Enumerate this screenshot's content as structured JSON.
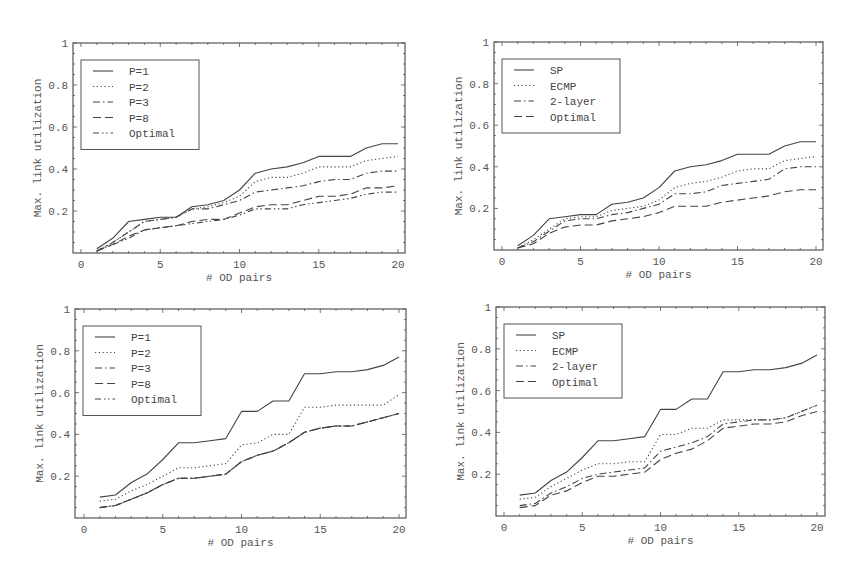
{
  "chart_data": [
    {
      "type": "line",
      "panel": "top-left",
      "title": "",
      "xlabel": "# OD pairs",
      "ylabel": "Max. link utilization",
      "xlim": [
        0,
        20
      ],
      "ylim": [
        0,
        1
      ],
      "xticks": [
        "0",
        "5",
        "10",
        "15",
        "20"
      ],
      "yticks": [
        "0.2",
        "0.4",
        "0.6",
        "0.8",
        "1"
      ],
      "grid": false,
      "legend_position": "upper-left",
      "x": [
        1,
        2,
        3,
        4,
        5,
        6,
        7,
        8,
        9,
        10,
        11,
        12,
        13,
        14,
        15,
        16,
        17,
        18,
        19,
        20
      ],
      "series": [
        {
          "name": "P=1",
          "style": "solid",
          "values": [
            0.02,
            0.07,
            0.15,
            0.16,
            0.17,
            0.17,
            0.22,
            0.23,
            0.25,
            0.3,
            0.38,
            0.4,
            0.41,
            0.43,
            0.46,
            0.46,
            0.46,
            0.5,
            0.52,
            0.52
          ]
        },
        {
          "name": "P=2",
          "style": "dotted",
          "values": [
            0.01,
            0.05,
            0.1,
            0.15,
            0.16,
            0.17,
            0.21,
            0.22,
            0.24,
            0.27,
            0.34,
            0.36,
            0.36,
            0.38,
            0.41,
            0.41,
            0.41,
            0.44,
            0.45,
            0.46
          ]
        },
        {
          "name": "P=3",
          "style": "dashdot",
          "values": [
            0.01,
            0.05,
            0.1,
            0.15,
            0.16,
            0.17,
            0.21,
            0.21,
            0.23,
            0.25,
            0.29,
            0.3,
            0.31,
            0.32,
            0.34,
            0.35,
            0.35,
            0.38,
            0.39,
            0.39
          ]
        },
        {
          "name": "P=8",
          "style": "longdash",
          "values": [
            0.01,
            0.04,
            0.08,
            0.11,
            0.12,
            0.13,
            0.15,
            0.16,
            0.16,
            0.19,
            0.22,
            0.23,
            0.23,
            0.25,
            0.27,
            0.27,
            0.28,
            0.31,
            0.31,
            0.32
          ]
        },
        {
          "name": "Optimal",
          "style": "dashdotdot",
          "values": [
            0.01,
            0.04,
            0.07,
            0.11,
            0.12,
            0.13,
            0.14,
            0.15,
            0.16,
            0.18,
            0.21,
            0.21,
            0.21,
            0.23,
            0.24,
            0.25,
            0.26,
            0.28,
            0.29,
            0.29
          ]
        }
      ]
    },
    {
      "type": "line",
      "panel": "top-right",
      "title": "",
      "xlabel": "# OD pairs",
      "ylabel": "Max. link utilization",
      "xlim": [
        0,
        20
      ],
      "ylim": [
        0,
        1
      ],
      "xticks": [
        "0",
        "5",
        "10",
        "15",
        "20"
      ],
      "yticks": [
        "0.2",
        "0.4",
        "0.6",
        "0.8",
        "1"
      ],
      "grid": false,
      "legend_position": "upper-left",
      "x": [
        1,
        2,
        3,
        4,
        5,
        6,
        7,
        8,
        9,
        10,
        11,
        12,
        13,
        14,
        15,
        16,
        17,
        18,
        19,
        20
      ],
      "series": [
        {
          "name": "SP",
          "style": "solid",
          "values": [
            0.02,
            0.07,
            0.15,
            0.16,
            0.17,
            0.17,
            0.22,
            0.23,
            0.25,
            0.3,
            0.38,
            0.4,
            0.41,
            0.43,
            0.46,
            0.46,
            0.46,
            0.5,
            0.52,
            0.52
          ]
        },
        {
          "name": "ECMP",
          "style": "dotted",
          "values": [
            0.01,
            0.05,
            0.1,
            0.15,
            0.16,
            0.16,
            0.19,
            0.2,
            0.21,
            0.24,
            0.3,
            0.32,
            0.33,
            0.35,
            0.38,
            0.39,
            0.39,
            0.43,
            0.44,
            0.45
          ]
        },
        {
          "name": "2-layer",
          "style": "dashdot",
          "values": [
            0.01,
            0.04,
            0.09,
            0.14,
            0.15,
            0.15,
            0.17,
            0.18,
            0.2,
            0.22,
            0.27,
            0.27,
            0.28,
            0.31,
            0.32,
            0.33,
            0.34,
            0.39,
            0.4,
            0.4
          ]
        },
        {
          "name": "Optimal",
          "style": "longdash",
          "values": [
            0.01,
            0.03,
            0.08,
            0.11,
            0.12,
            0.12,
            0.14,
            0.15,
            0.16,
            0.18,
            0.21,
            0.21,
            0.21,
            0.23,
            0.24,
            0.25,
            0.26,
            0.28,
            0.29,
            0.29
          ]
        }
      ]
    },
    {
      "type": "line",
      "panel": "bottom-left",
      "title": "",
      "xlabel": "# OD pairs",
      "ylabel": "Max. link utilization",
      "xlim": [
        0,
        20
      ],
      "ylim": [
        0,
        1
      ],
      "xticks": [
        "0",
        "5",
        "10",
        "15",
        "20"
      ],
      "yticks": [
        "0.2",
        "0.4",
        "0.6",
        "0.8",
        "1"
      ],
      "grid": false,
      "legend_position": "upper-left",
      "x": [
        1,
        2,
        3,
        4,
        5,
        6,
        7,
        8,
        9,
        10,
        11,
        12,
        13,
        14,
        15,
        16,
        17,
        18,
        19,
        20
      ],
      "series": [
        {
          "name": "P=1",
          "style": "solid",
          "values": [
            0.1,
            0.11,
            0.17,
            0.21,
            0.28,
            0.36,
            0.36,
            0.37,
            0.38,
            0.51,
            0.51,
            0.56,
            0.56,
            0.69,
            0.69,
            0.7,
            0.7,
            0.71,
            0.73,
            0.77
          ]
        },
        {
          "name": "P=2",
          "style": "dotted",
          "values": [
            0.08,
            0.09,
            0.13,
            0.16,
            0.2,
            0.24,
            0.24,
            0.25,
            0.26,
            0.35,
            0.36,
            0.4,
            0.4,
            0.53,
            0.53,
            0.54,
            0.54,
            0.54,
            0.54,
            0.59
          ]
        },
        {
          "name": "P=3",
          "style": "dashdot",
          "values": [
            0.05,
            0.06,
            0.09,
            0.12,
            0.16,
            0.19,
            0.19,
            0.2,
            0.21,
            0.27,
            0.3,
            0.32,
            0.36,
            0.41,
            0.43,
            0.44,
            0.44,
            0.46,
            0.48,
            0.5
          ]
        },
        {
          "name": "P=8",
          "style": "longdash",
          "values": [
            0.05,
            0.06,
            0.09,
            0.12,
            0.16,
            0.19,
            0.19,
            0.2,
            0.21,
            0.27,
            0.3,
            0.32,
            0.36,
            0.41,
            0.43,
            0.44,
            0.44,
            0.46,
            0.48,
            0.5
          ]
        },
        {
          "name": "Optimal",
          "style": "dashdotdot",
          "values": [
            0.05,
            0.06,
            0.09,
            0.12,
            0.16,
            0.19,
            0.19,
            0.2,
            0.21,
            0.27,
            0.3,
            0.32,
            0.36,
            0.41,
            0.43,
            0.44,
            0.44,
            0.46,
            0.48,
            0.5
          ]
        }
      ]
    },
    {
      "type": "line",
      "panel": "bottom-right",
      "title": "",
      "xlabel": "# OD pairs",
      "ylabel": "Max. link utilization",
      "xlim": [
        0,
        20
      ],
      "ylim": [
        0,
        1
      ],
      "xticks": [
        "0",
        "5",
        "10",
        "15",
        "20"
      ],
      "yticks": [
        "0.2",
        "0.4",
        "0.6",
        "0.8",
        "1"
      ],
      "grid": false,
      "legend_position": "upper-left",
      "x": [
        1,
        2,
        3,
        4,
        5,
        6,
        7,
        8,
        9,
        10,
        11,
        12,
        13,
        14,
        15,
        16,
        17,
        18,
        19,
        20
      ],
      "series": [
        {
          "name": "SP",
          "style": "solid",
          "values": [
            0.1,
            0.11,
            0.17,
            0.21,
            0.28,
            0.36,
            0.36,
            0.37,
            0.38,
            0.51,
            0.51,
            0.56,
            0.56,
            0.69,
            0.69,
            0.7,
            0.7,
            0.71,
            0.73,
            0.77
          ]
        },
        {
          "name": "ECMP",
          "style": "dotted",
          "values": [
            0.08,
            0.09,
            0.14,
            0.18,
            0.22,
            0.25,
            0.25,
            0.26,
            0.26,
            0.39,
            0.39,
            0.42,
            0.42,
            0.46,
            0.46,
            0.46,
            0.46,
            0.47,
            0.5,
            0.53
          ]
        },
        {
          "name": "2-layer",
          "style": "dashdot",
          "values": [
            0.05,
            0.06,
            0.11,
            0.14,
            0.18,
            0.2,
            0.21,
            0.22,
            0.23,
            0.31,
            0.33,
            0.35,
            0.38,
            0.44,
            0.45,
            0.46,
            0.46,
            0.47,
            0.5,
            0.53
          ]
        },
        {
          "name": "Optimal",
          "style": "longdash",
          "values": [
            0.04,
            0.05,
            0.1,
            0.12,
            0.16,
            0.19,
            0.19,
            0.2,
            0.21,
            0.27,
            0.3,
            0.32,
            0.36,
            0.42,
            0.43,
            0.44,
            0.44,
            0.45,
            0.48,
            0.5
          ]
        }
      ]
    }
  ],
  "panels": [
    {
      "id": "top-left",
      "xlabel": "# OD pairs",
      "ylabel": "Max. link utilization",
      "legend": [
        "P=1",
        "P=2",
        "P=3",
        "P=8",
        "Optimal"
      ]
    },
    {
      "id": "top-right",
      "xlabel": "# OD pairs",
      "ylabel": "Max. link utilization",
      "legend": [
        "SP",
        "ECMP",
        "2-layer",
        "Optimal"
      ]
    },
    {
      "id": "bottom-left",
      "xlabel": "# OD pairs",
      "ylabel": "Max. link utilization",
      "legend": [
        "P=1",
        "P=2",
        "P=3",
        "P=8",
        "Optimal"
      ]
    },
    {
      "id": "bottom-right",
      "xlabel": "# OD pairs",
      "ylabel": "Max. link utilization",
      "legend": [
        "SP",
        "ECMP",
        "2-layer",
        "Optimal"
      ]
    }
  ],
  "colors": {
    "line": "#444444",
    "axis": "#555555",
    "text": "#555555"
  }
}
